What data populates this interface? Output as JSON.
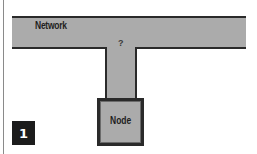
{
  "diagram": {
    "network": {
      "label": "Network"
    },
    "connector": {
      "label": "?"
    },
    "node": {
      "label": "Node"
    },
    "step_badge": {
      "label": "1"
    }
  },
  "colors": {
    "fill": "#ababab",
    "stroke": "#2a2a2a",
    "badge_bg": "#1c1c1c",
    "badge_text": "#ffffff",
    "background": "#ffffff"
  }
}
